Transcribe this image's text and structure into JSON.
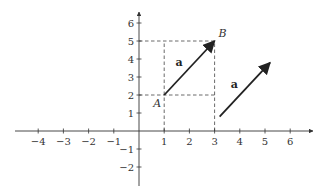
{
  "chart_data": {
    "type": "vector-plot",
    "title": "",
    "xlabel": "",
    "ylabel": "",
    "xlim": [
      -5,
      7
    ],
    "ylim": [
      -3,
      6.6
    ],
    "x_ticks": [
      -4,
      -3,
      -2,
      -1,
      1,
      2,
      3,
      4,
      5,
      6
    ],
    "x_tick_labels": [
      "−4",
      "−3",
      "−2",
      "−1",
      "1",
      "2",
      "3",
      "4",
      "5",
      "6"
    ],
    "y_ticks": [
      -2,
      -1,
      1,
      2,
      3,
      4,
      5,
      6
    ],
    "y_tick_labels": [
      "−2",
      "−1",
      "1",
      "2",
      "3",
      "4",
      "5",
      "6"
    ],
    "grid": false,
    "points": [
      {
        "name": "A",
        "x": 1,
        "y": 2
      },
      {
        "name": "B",
        "x": 3,
        "y": 5
      }
    ],
    "vectors": [
      {
        "label": "a",
        "from": [
          1,
          2
        ],
        "to": [
          3,
          5
        ]
      },
      {
        "label": "a",
        "from": [
          3.2,
          0.8
        ],
        "to": [
          5.2,
          3.8
        ]
      }
    ],
    "guide_lines": [
      {
        "from": [
          0,
          5
        ],
        "to": [
          3,
          5
        ]
      },
      {
        "from": [
          0,
          2
        ],
        "to": [
          3,
          2
        ]
      },
      {
        "from": [
          1,
          0
        ],
        "to": [
          1,
          5
        ]
      },
      {
        "from": [
          3,
          0
        ],
        "to": [
          3,
          5
        ]
      }
    ]
  }
}
